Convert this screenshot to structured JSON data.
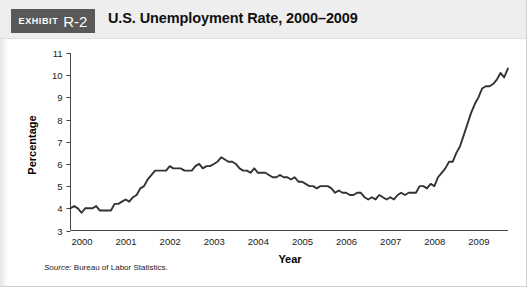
{
  "exhibit": {
    "word": "Exhibit",
    "number": "R-2"
  },
  "header": {
    "title": "U.S. Unemployment Rate, 2000–2009"
  },
  "source": {
    "label": "Source:",
    "text": "Bureau of Labor Statistics."
  },
  "chart_data": {
    "type": "line",
    "title": "U.S. Unemployment Rate, 2000–2009",
    "xlabel": "Year",
    "ylabel": "Percentage",
    "xlim": [
      2000,
      2009.92
    ],
    "ylim": [
      3,
      11
    ],
    "yticks": [
      3,
      4,
      5,
      6,
      7,
      8,
      9,
      10,
      11
    ],
    "xticks": [
      2000,
      2001,
      2002,
      2003,
      2004,
      2005,
      2006,
      2007,
      2008,
      2009
    ],
    "xtick_labels": [
      "2000",
      "2001",
      "2002",
      "2003",
      "2004",
      "2005",
      "2006",
      "2007",
      "2008",
      "2009"
    ],
    "ytick_labels": [
      "3",
      "4",
      "5",
      "6",
      "7",
      "8",
      "9",
      "10",
      "11"
    ],
    "grid": false,
    "legend": "none",
    "line_color": "#333333",
    "series": [
      {
        "name": "U.S. Unemployment Rate",
        "units": "percent",
        "frequency": "monthly",
        "x": [
          2000.0,
          2000.083,
          2000.167,
          2000.25,
          2000.333,
          2000.417,
          2000.5,
          2000.583,
          2000.667,
          2000.75,
          2000.833,
          2000.917,
          2001.0,
          2001.083,
          2001.167,
          2001.25,
          2001.333,
          2001.417,
          2001.5,
          2001.583,
          2001.667,
          2001.75,
          2001.833,
          2001.917,
          2002.0,
          2002.083,
          2002.167,
          2002.25,
          2002.333,
          2002.417,
          2002.5,
          2002.583,
          2002.667,
          2002.75,
          2002.833,
          2002.917,
          2003.0,
          2003.083,
          2003.167,
          2003.25,
          2003.333,
          2003.417,
          2003.5,
          2003.583,
          2003.667,
          2003.75,
          2003.833,
          2003.917,
          2004.0,
          2004.083,
          2004.167,
          2004.25,
          2004.333,
          2004.417,
          2004.5,
          2004.583,
          2004.667,
          2004.75,
          2004.833,
          2004.917,
          2005.0,
          2005.083,
          2005.167,
          2005.25,
          2005.333,
          2005.417,
          2005.5,
          2005.583,
          2005.667,
          2005.75,
          2005.833,
          2005.917,
          2006.0,
          2006.083,
          2006.167,
          2006.25,
          2006.333,
          2006.417,
          2006.5,
          2006.583,
          2006.667,
          2006.75,
          2006.833,
          2006.917,
          2007.0,
          2007.083,
          2007.167,
          2007.25,
          2007.333,
          2007.417,
          2007.5,
          2007.583,
          2007.667,
          2007.75,
          2007.833,
          2007.917,
          2008.0,
          2008.083,
          2008.167,
          2008.25,
          2008.333,
          2008.417,
          2008.5,
          2008.583,
          2008.667,
          2008.75,
          2008.833,
          2008.917,
          2009.0,
          2009.083,
          2009.167,
          2009.25,
          2009.333,
          2009.417,
          2009.5,
          2009.583,
          2009.667,
          2009.75,
          2009.833,
          2009.917
        ],
        "values": [
          4.0,
          4.1,
          4.0,
          3.8,
          4.0,
          4.0,
          4.0,
          4.1,
          3.9,
          3.9,
          3.9,
          3.9,
          4.2,
          4.2,
          4.3,
          4.4,
          4.3,
          4.5,
          4.6,
          4.9,
          5.0,
          5.3,
          5.5,
          5.7,
          5.7,
          5.7,
          5.7,
          5.9,
          5.8,
          5.8,
          5.8,
          5.7,
          5.7,
          5.7,
          5.9,
          6.0,
          5.8,
          5.9,
          5.9,
          6.0,
          6.1,
          6.3,
          6.2,
          6.1,
          6.1,
          6.0,
          5.8,
          5.7,
          5.7,
          5.6,
          5.8,
          5.6,
          5.6,
          5.6,
          5.5,
          5.4,
          5.4,
          5.5,
          5.4,
          5.4,
          5.3,
          5.4,
          5.2,
          5.2,
          5.1,
          5.0,
          5.0,
          4.9,
          5.0,
          5.0,
          5.0,
          4.9,
          4.7,
          4.8,
          4.7,
          4.7,
          4.6,
          4.6,
          4.7,
          4.7,
          4.5,
          4.4,
          4.5,
          4.4,
          4.6,
          4.5,
          4.4,
          4.5,
          4.4,
          4.6,
          4.7,
          4.6,
          4.7,
          4.7,
          4.7,
          5.0,
          5.0,
          4.9,
          5.1,
          5.0,
          5.4,
          5.6,
          5.8,
          6.1,
          6.1,
          6.5,
          6.8,
          7.3,
          7.8,
          8.3,
          8.7,
          9.0,
          9.4,
          9.5,
          9.5,
          9.6,
          9.8,
          10.1,
          9.9,
          10.3
        ]
      }
    ]
  }
}
